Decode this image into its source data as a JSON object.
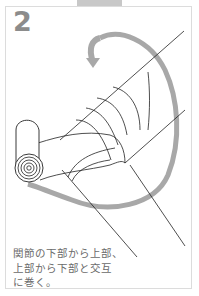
{
  "step": {
    "number": "2"
  },
  "caption": {
    "lines": [
      "関節の下部から上部、",
      "上部から下部と交互",
      "に巻く。"
    ]
  },
  "illustration": {
    "subject": "bandage-figure-eight-wrap-joint",
    "arrow_color": "#a8a8a8",
    "line_color": "#222222"
  },
  "colors": {
    "tab": "#c8c8c8",
    "frame_border": "#dcdcdc",
    "step_number": "#8c8c8c",
    "caption_text": "#6a6a6a"
  }
}
